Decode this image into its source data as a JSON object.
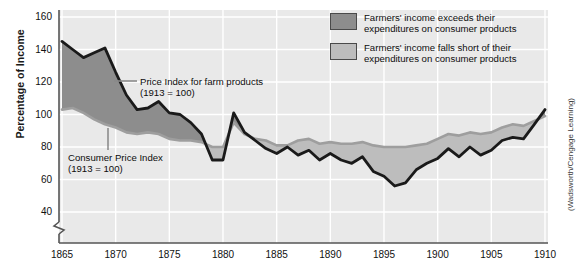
{
  "axes": {
    "ylabel": "Percentage of Income",
    "yticks": [
      "160",
      "140",
      "120",
      "100",
      "80",
      "60",
      "40"
    ],
    "xticks": [
      "1865",
      "1870",
      "1875",
      "1880",
      "1885",
      "1890",
      "1895",
      "1900",
      "1905",
      "1910"
    ]
  },
  "legend": {
    "items": [
      {
        "swatch": "dark",
        "line1": "Farmers' income exceeds their",
        "line2": "expenditures on consumer products"
      },
      {
        "swatch": "light",
        "line1": "Farmers' income falls short of their",
        "line2": "expenditures on consumer products"
      }
    ]
  },
  "annotations": {
    "farm": {
      "line1": "Price Index for farm products",
      "line2": "(1913 = 100)"
    },
    "cpi": {
      "line1": "Consumer Price Index",
      "line2": "(1913 = 100)"
    }
  },
  "credit": "(Wadsworth/Cengage Learning)",
  "colors": {
    "plot_background": "#e9e9e9",
    "gridline": "#ffffff",
    "farm_line": "#1a1a1a",
    "cpi_line": "#9e9e9e",
    "fill_exceeds": "#8d8d8d",
    "fill_short": "#bdbdbd",
    "axis": "#555555"
  },
  "chart_data": {
    "type": "line",
    "title": "",
    "subtitle": "",
    "xlabel": "",
    "ylabel": "Percentage of Income",
    "xlim": [
      1865,
      1910
    ],
    "ylim": [
      40,
      160
    ],
    "ybreak_below": 40,
    "grid": true,
    "legend_position": "top-right",
    "x": [
      1865,
      1866,
      1867,
      1868,
      1869,
      1870,
      1871,
      1872,
      1873,
      1874,
      1875,
      1876,
      1877,
      1878,
      1879,
      1880,
      1881,
      1882,
      1883,
      1884,
      1885,
      1886,
      1887,
      1888,
      1889,
      1890,
      1891,
      1892,
      1893,
      1894,
      1895,
      1896,
      1897,
      1898,
      1899,
      1900,
      1901,
      1902,
      1903,
      1904,
      1905,
      1906,
      1907,
      1908,
      1909,
      1910
    ],
    "series": [
      {
        "name": "Price Index for farm products (1913 = 100)",
        "color": "#1a1a1a",
        "values": [
          145,
          140,
          135,
          138,
          141,
          126,
          112,
          103,
          104,
          108,
          101,
          100,
          95,
          88,
          72,
          72,
          101,
          89,
          84,
          79,
          76,
          80,
          75,
          78,
          72,
          76,
          72,
          70,
          74,
          65,
          62,
          56,
          58,
          66,
          70,
          73,
          79,
          74,
          80,
          75,
          78,
          84,
          86,
          85,
          94,
          103
        ]
      },
      {
        "name": "Consumer Price Index (1913 = 100)",
        "color": "#9e9e9e",
        "values": [
          103,
          104,
          101,
          97,
          94,
          92,
          89,
          88,
          89,
          88,
          85,
          84,
          84,
          83,
          80,
          80,
          95,
          88,
          85,
          84,
          81,
          81,
          84,
          85,
          82,
          83,
          82,
          82,
          83,
          81,
          80,
          80,
          80,
          81,
          82,
          85,
          88,
          87,
          89,
          88,
          89,
          92,
          94,
          93,
          96,
          99
        ]
      }
    ],
    "fill_rule": {
      "above_label": "Farmers' income exceeds their expenditures on consumer products",
      "below_label": "Farmers' income falls short of their expenditures on consumer products",
      "above_color": "#8d8d8d",
      "below_color": "#bdbdbd"
    },
    "annotations": [
      {
        "text": "Price Index for farm products (1913 = 100)",
        "x": 1875,
        "y": 118
      },
      {
        "text": "Consumer Price Index (1913 = 100)",
        "x": 1872,
        "y": 68
      }
    ]
  }
}
